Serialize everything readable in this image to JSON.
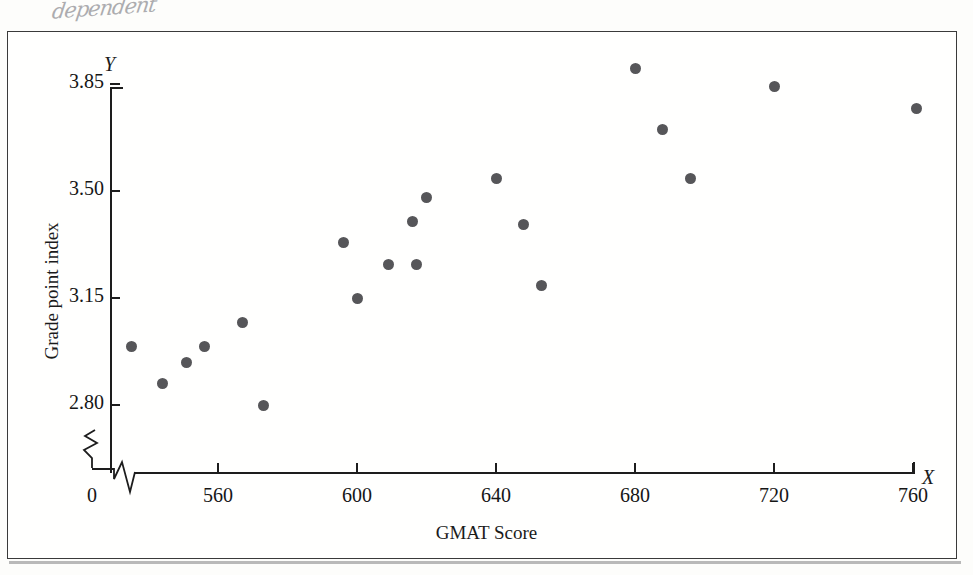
{
  "annotation": {
    "handwritten_note": "dependent"
  },
  "chart_data": {
    "type": "scatter",
    "title": "",
    "xlabel": "GMAT Score",
    "ylabel": "Grade point index",
    "x_axis_symbol": "X",
    "y_axis_symbol": "Y",
    "xticks": [
      0,
      560,
      600,
      640,
      680,
      720,
      760
    ],
    "xtick_labels": [
      "0",
      "560",
      "600",
      "640",
      "680",
      "720",
      "760"
    ],
    "yticks": [
      2.8,
      3.15,
      3.5,
      3.85
    ],
    "ytick_labels": [
      "2.80",
      "3.15",
      "3.50",
      "3.85"
    ],
    "xlim": [
      560,
      760
    ],
    "ylim": [
      2.8,
      3.85
    ],
    "axis_break_x": true,
    "axis_break_y": true,
    "grid": false,
    "legend": null,
    "marker_color": "#565659",
    "marker_size": 11,
    "points": [
      {
        "x": 535,
        "y": 2.99
      },
      {
        "x": 544,
        "y": 2.87
      },
      {
        "x": 551,
        "y": 2.94
      },
      {
        "x": 556,
        "y": 2.99
      },
      {
        "x": 567,
        "y": 3.07
      },
      {
        "x": 573,
        "y": 2.8
      },
      {
        "x": 596,
        "y": 3.33
      },
      {
        "x": 600,
        "y": 3.15
      },
      {
        "x": 609,
        "y": 3.26
      },
      {
        "x": 616,
        "y": 3.4
      },
      {
        "x": 617,
        "y": 3.26
      },
      {
        "x": 620,
        "y": 3.48
      },
      {
        "x": 640,
        "y": 3.54
      },
      {
        "x": 648,
        "y": 3.39
      },
      {
        "x": 653,
        "y": 3.19
      },
      {
        "x": 680,
        "y": 3.9
      },
      {
        "x": 688,
        "y": 3.7
      },
      {
        "x": 696,
        "y": 3.54
      },
      {
        "x": 720,
        "y": 3.84
      },
      {
        "x": 761,
        "y": 3.77
      }
    ]
  }
}
